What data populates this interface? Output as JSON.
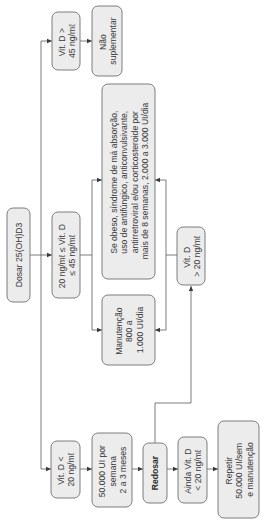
{
  "diagram": {
    "orientation": "rotated 90 degrees counter-clockwise",
    "nodes": {
      "start": {
        "lines": [
          "Dosar 25(OH)D3"
        ]
      },
      "gt45": {
        "lines": [
          "Vit. D >",
          "45 ng/mℓ"
        ]
      },
      "nao": {
        "lines": [
          "Não",
          "suplementar"
        ]
      },
      "mid": {
        "lines": [
          "20 ng/mℓ ≤ Vit. D",
          "≤ 45 ng/mℓ"
        ]
      },
      "obeso": {
        "lines": [
          "Se obeso, síndrome de má absorção,",
          "uso de antifúngico, anticonvulsivante,",
          "antirretroviral e/ou corticosteroide por",
          "mais de 8 semanas, 2.000 a 3.000 UI/dia"
        ]
      },
      "manut": {
        "lines": [
          "Manutenção",
          "800 a",
          "1.000 UI/dia"
        ]
      },
      "gt20": {
        "lines": [
          "Vit. D",
          "> 20 ng/mℓ"
        ]
      },
      "lt20": {
        "lines": [
          "Vit. D <",
          "20 ng/mℓ"
        ]
      },
      "dose": {
        "lines": [
          "50.000 UI por",
          "semana",
          "2 a 3 meses"
        ]
      },
      "redosar": {
        "lines": [
          "Redosar"
        ]
      },
      "ainda": {
        "lines": [
          "Ainda Vit. D",
          "< 20 ng/mℓ"
        ]
      },
      "repetir": {
        "lines": [
          "Repetir",
          "50.000 UI/sem",
          "e manutenção"
        ]
      }
    },
    "edges": [
      [
        "start",
        "gt45"
      ],
      [
        "start",
        "mid"
      ],
      [
        "start",
        "lt20"
      ],
      [
        "gt45",
        "nao"
      ],
      [
        "mid",
        "obeso"
      ],
      [
        "mid",
        "manut"
      ],
      [
        "lt20",
        "dose"
      ],
      [
        "dose",
        "redosar"
      ],
      [
        "redosar",
        "ainda"
      ],
      [
        "ainda",
        "repetir"
      ],
      [
        "redosar",
        "gt20"
      ],
      [
        "gt20",
        "obeso"
      ],
      [
        "gt20",
        "manut"
      ]
    ]
  }
}
